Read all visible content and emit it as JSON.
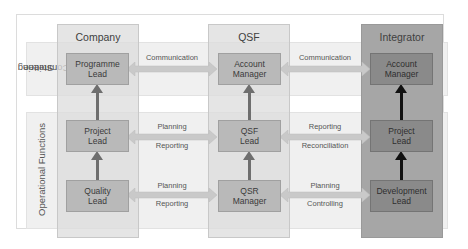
{
  "diagram": {
    "rows": [
      {
        "id": "steering",
        "label": "Steering Committee",
        "label_lines": [
          "Steering",
          "Committee"
        ]
      },
      {
        "id": "operational",
        "label": "Operational Functions"
      }
    ],
    "columns": [
      {
        "id": "company",
        "title": "Company",
        "boxes": [
          "Programme Lead",
          "Project Lead",
          "Quality Lead"
        ]
      },
      {
        "id": "qsf",
        "title": "QSF",
        "boxes": [
          "Account Manager",
          "QSF Lead",
          "QSR Manager"
        ]
      },
      {
        "id": "integrator",
        "title": "Integrator",
        "boxes": [
          "Account Manager",
          "Project Lead",
          "Development Lead"
        ]
      }
    ],
    "boxes": {
      "company_0": [
        "Programme",
        "Lead"
      ],
      "company_1": [
        "Project",
        "Lead"
      ],
      "company_2": [
        "Quality",
        "Lead"
      ],
      "qsf_0": [
        "Account",
        "Manager"
      ],
      "qsf_1": [
        "QSF",
        "Lead"
      ],
      "qsf_2": [
        "QSR",
        "Manager"
      ],
      "integrator_0": [
        "Account",
        "Manager"
      ],
      "integrator_1": [
        "Project",
        "Lead"
      ],
      "integrator_2": [
        "Development",
        "Lead"
      ]
    },
    "links": {
      "company_qsf_0": {
        "top": "Communication",
        "bottom": ""
      },
      "company_qsf_1": {
        "top": "Planning",
        "bottom": "Reporting"
      },
      "company_qsf_2": {
        "top": "Planning",
        "bottom": "Reporting"
      },
      "qsf_integrator_0": {
        "top": "Communication",
        "bottom": ""
      },
      "qsf_integrator_1": {
        "top": "Reporting",
        "bottom": "Reconciliation"
      },
      "qsf_integrator_2": {
        "top": "Planning",
        "bottom": "Controlling"
      }
    },
    "colors": {
      "column_light": "#dcdcdc",
      "column_dark": "#a6a6a6",
      "box_light": "#b9b9b9",
      "box_dark": "#8a8a8a",
      "arrow_horizontal": "#c9c9c9",
      "arrow_vertical_light": "#6e6e6e",
      "arrow_vertical_dark": "#111111"
    }
  }
}
